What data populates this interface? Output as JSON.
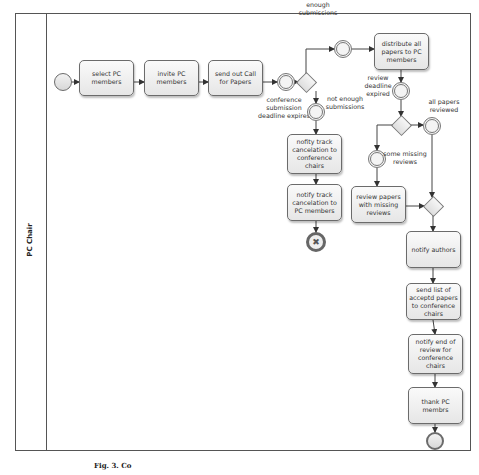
{
  "pool": {
    "lane_label": "PC Chair"
  },
  "tasks": {
    "select_pc": "select PC members",
    "invite_pc": "invite PC members",
    "send_cfp": "send out Call for Papers",
    "distribute": "distribute all papers to PC members",
    "cancel_conf": "nofity track cancelation to conference chairs",
    "cancel_pc": "notify track cancelation to PC members",
    "review_missing": "review papers with missing reviews",
    "notify_authors": "notify authors",
    "send_list": "send list of acceptd papers to conference chairs",
    "notify_end": "notify end of review for conference chairs",
    "thank_pc": "thank PC membrs"
  },
  "labels": {
    "deadline_expires": "conference submission deadline expires",
    "enough": "enough submissions",
    "not_enough": "not enough submissions",
    "review_deadline": "review deadline expired",
    "all_reviewed": "all papers reviewed",
    "some_missing": "some missing reviews"
  },
  "icons": {
    "cancel_end": "✖"
  },
  "caption": "Fig. 3. Co"
}
